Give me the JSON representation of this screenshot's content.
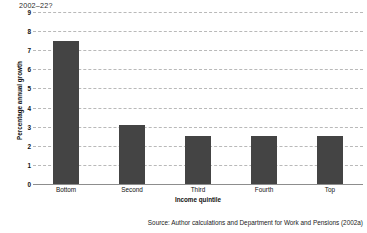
{
  "chart_data": {
    "type": "bar",
    "title": "2002–22?",
    "categories": [
      "Bottom",
      "Second",
      "Third",
      "Fourth",
      "Top"
    ],
    "values": [
      7.5,
      3.1,
      2.5,
      2.5,
      2.5
    ],
    "xlabel": "Income quintile",
    "ylabel": "Percentage annual growth",
    "ylim": [
      0,
      9
    ],
    "yticks": [
      0,
      1,
      2,
      3,
      4,
      5,
      6,
      7,
      8,
      9
    ],
    "ytick_labels": [
      "0",
      "1",
      "2",
      "3",
      "4",
      "5",
      "6",
      "7",
      "8",
      "9"
    ],
    "grid": true,
    "grid_axis": "y",
    "grid_style": "dashed",
    "legend": false,
    "bar_color": "#444444",
    "grid_color": "#b9b9b9",
    "axis_color": "#8d8d8d",
    "background": "#ffffff"
  },
  "source_note": "Source: Author calculations and Department for Work and Pensions (2002a)"
}
